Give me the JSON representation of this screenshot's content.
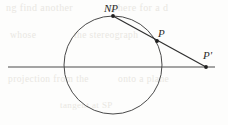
{
  "figure": {
    "caption_present": false,
    "background_color": "#fdfdfc",
    "ink_color": "#3a3a3a",
    "label_color": "#2b2b2b",
    "ghost_color": "#e9e7e2",
    "width": 228,
    "height": 125
  },
  "labels": {
    "north_pole": "NP",
    "point_on_circle": "P",
    "projected_point": "P'"
  },
  "geometry": {
    "circle": {
      "cx": 113,
      "cy": 65,
      "r": 49,
      "stroke": "#4a4a4a",
      "stroke_width": 1
    },
    "horizontal_line": {
      "x1": 8,
      "y1": 67,
      "x2": 215,
      "y2": 67,
      "stroke": "#4a4a4a",
      "stroke_width": 1
    },
    "projection_line": {
      "x1": 113,
      "y1": 16,
      "x2": 206,
      "y2": 67,
      "stroke": "#2f2f2f",
      "stroke_width": 1.2
    },
    "points": [
      {
        "name": "NP",
        "x": 113,
        "y": 16,
        "r": 1.9
      },
      {
        "name": "P",
        "x": 157,
        "y": 41,
        "r": 1.9
      },
      {
        "name": "P'",
        "x": 206,
        "y": 67,
        "r": 1.9
      }
    ]
  },
  "ghost_text": {
    "line_a": "ng find another",
    "line_b": "sphere for a d",
    "line_c": "whose",
    "line_d": "the stereograph",
    "line_e": "projection from the",
    "line_f": "onto a plane",
    "line_g": "tangent at SP"
  },
  "chart_data": {
    "type": "diagram",
    "title": "",
    "elements": [
      {
        "kind": "circle",
        "center": [
          113,
          65
        ],
        "radius": 49
      },
      {
        "kind": "line",
        "label": "projection plane",
        "from": [
          8,
          67
        ],
        "to": [
          215,
          67
        ]
      },
      {
        "kind": "line",
        "label": "projection ray",
        "from": [
          113,
          16
        ],
        "to": [
          206,
          67
        ]
      },
      {
        "kind": "point",
        "label": "NP",
        "at": [
          113,
          16
        ]
      },
      {
        "kind": "point",
        "label": "P",
        "at": [
          157,
          41
        ]
      },
      {
        "kind": "point",
        "label": "P'",
        "at": [
          206,
          67
        ]
      }
    ]
  }
}
